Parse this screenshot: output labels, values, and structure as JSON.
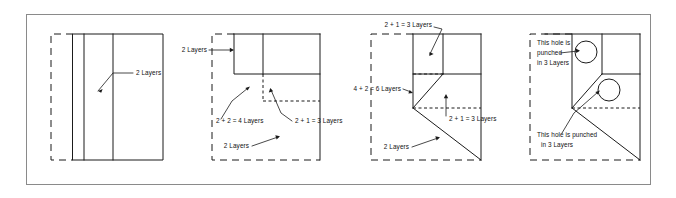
{
  "figure": {
    "panel_count": 4,
    "colors": {
      "background": "#ffffff",
      "frame": "#8a8a8a",
      "ink": "#1b1b1b"
    }
  },
  "panels": [
    {
      "id": "panel-1",
      "name": "unfolded-sheet",
      "labels": [
        {
          "key": "l1",
          "text": "2 Layers"
        }
      ]
    },
    {
      "id": "panel-2",
      "name": "first-fold",
      "labels": [
        {
          "key": "l1",
          "text": "2 Layers"
        },
        {
          "key": "l2",
          "text": "2 + 2 = 4 Layers"
        },
        {
          "key": "l3",
          "text": "2 + 1 = 3 Layers"
        },
        {
          "key": "l4",
          "text": "2 Layers"
        }
      ]
    },
    {
      "id": "panel-3",
      "name": "diagonal-fold",
      "labels": [
        {
          "key": "l1",
          "text": "2 + 1 = 3 Layers"
        },
        {
          "key": "l2",
          "text": "4 + 2 = 6 Layers"
        },
        {
          "key": "l3",
          "text": "2 + 1 = 3 Layers"
        },
        {
          "key": "l4",
          "text": "2 Layers"
        }
      ]
    },
    {
      "id": "panel-4",
      "name": "punched-holes",
      "labels": [
        {
          "key": "l1a",
          "text": "This hole is"
        },
        {
          "key": "l1b",
          "text": "punched"
        },
        {
          "key": "l1c",
          "text": "in 3 Layers"
        },
        {
          "key": "l2a",
          "text": "This hole is punched"
        },
        {
          "key": "l2b",
          "text": "in 3 Layers"
        }
      ],
      "holes": [
        {
          "key": "hole-upper",
          "label": "upper-punched-hole"
        },
        {
          "key": "hole-lower",
          "label": "lower-punched-hole"
        }
      ]
    }
  ]
}
